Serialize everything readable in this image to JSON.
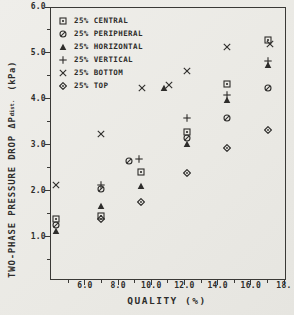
{
  "figure": {
    "paper_color": "#edecea",
    "ink_color": "#2e2d2b"
  },
  "chart_data": {
    "type": "scatter",
    "title": "",
    "xlabel": "QUALITY (%)",
    "ylabel": "TWO-PHASE PRESSURE DROP ΔP",
    "ylabel_subscript": "dist.",
    "ylabel_units": "(kPa)",
    "xlim": [
      3.89,
      18.0
    ],
    "ylim": [
      0.1,
      6.0
    ],
    "x_ticks": [
      6,
      8,
      10,
      12,
      14,
      16,
      18
    ],
    "x_tick_labels": [
      "6.0",
      "8.0",
      "10.0",
      "12.0",
      "14.0",
      "16.0",
      "18."
    ],
    "x_minor_ticks": [
      5,
      7,
      9,
      11,
      13,
      15,
      17
    ],
    "y_ticks": [
      1,
      2,
      3,
      4,
      5,
      6
    ],
    "y_tick_labels": [
      "1.0",
      "2.0",
      "3.0",
      "4.0",
      "5.0",
      "6.0"
    ],
    "y_minor_ticks": [
      0.5,
      1.5,
      2.5,
      3.5,
      4.5,
      5.5
    ],
    "grid": false,
    "legend_position": "top-left-inside",
    "series": [
      {
        "name": "25% CENTRAL",
        "marker": "square-dot",
        "points": [
          [
            4.2,
            1.4
          ],
          [
            6.9,
            1.48
          ],
          [
            9.3,
            2.43
          ],
          [
            12.1,
            3.3
          ],
          [
            14.5,
            4.35
          ],
          [
            17.0,
            5.3
          ]
        ]
      },
      {
        "name": "25% PERIPHERAL",
        "marker": "circle-slash",
        "points": [
          [
            4.2,
            1.28
          ],
          [
            6.9,
            2.05
          ],
          [
            8.6,
            2.67
          ],
          [
            12.1,
            3.18
          ],
          [
            14.5,
            3.6
          ],
          [
            17.0,
            4.25
          ]
        ]
      },
      {
        "name": "25% HORIZONTAL",
        "marker": "triangle-filled",
        "points": [
          [
            4.2,
            1.15
          ],
          [
            6.9,
            1.7
          ],
          [
            9.3,
            2.13
          ],
          [
            10.7,
            4.25
          ],
          [
            12.1,
            3.05
          ],
          [
            14.5,
            4.0
          ],
          [
            17.0,
            4.75
          ]
        ]
      },
      {
        "name": "25% VERTICAL",
        "marker": "plus",
        "points": [
          [
            6.9,
            2.15
          ],
          [
            9.2,
            2.72
          ],
          [
            12.1,
            3.6
          ],
          [
            14.5,
            4.1
          ],
          [
            17.0,
            4.85
          ]
        ]
      },
      {
        "name": "25% BOTTOM",
        "marker": "x-cross",
        "points": [
          [
            4.2,
            2.15
          ],
          [
            6.9,
            3.25
          ],
          [
            9.4,
            4.25
          ],
          [
            11.0,
            4.33
          ],
          [
            12.1,
            4.62
          ],
          [
            14.5,
            5.15
          ],
          [
            17.1,
            5.22
          ]
        ]
      },
      {
        "name": "25% TOP",
        "marker": "diamond-dot",
        "points": [
          [
            6.9,
            1.4
          ],
          [
            9.3,
            1.78
          ],
          [
            12.1,
            2.4
          ],
          [
            14.5,
            2.95
          ],
          [
            17.0,
            3.35
          ]
        ]
      }
    ]
  }
}
